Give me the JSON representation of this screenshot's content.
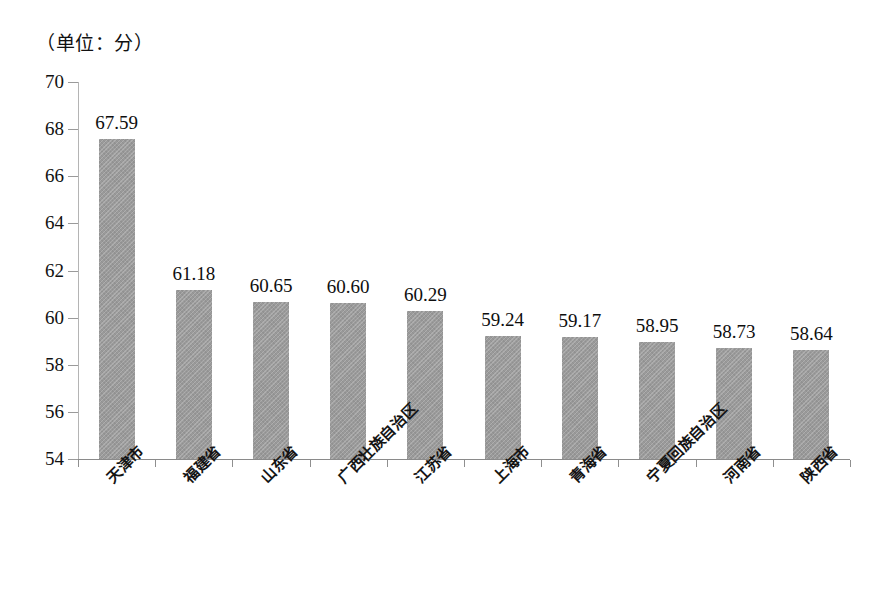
{
  "chart_data": {
    "type": "bar",
    "title": "",
    "unit_note": "（单位：分）",
    "xlabel": "",
    "ylabel": "",
    "ylim": [
      54,
      70
    ],
    "ytick_step": 2,
    "yticks": [
      70,
      68,
      66,
      64,
      62,
      60,
      58,
      56,
      54
    ],
    "grid": false,
    "legend": false,
    "bar_color": "#9a9a9a",
    "categories": [
      "天津市",
      "福建省",
      "山东省",
      "广西壮族自治区",
      "江苏省",
      "上海市",
      "青海省",
      "宁夏回族自治区",
      "河南省",
      "陕西省"
    ],
    "values": [
      67.59,
      61.18,
      60.65,
      60.6,
      60.29,
      59.24,
      59.17,
      58.95,
      58.73,
      58.64
    ],
    "value_labels": [
      "67.59",
      "61.18",
      "60.65",
      "60.60",
      "60.29",
      "59.24",
      "59.17",
      "58.95",
      "58.73",
      "58.64"
    ]
  }
}
